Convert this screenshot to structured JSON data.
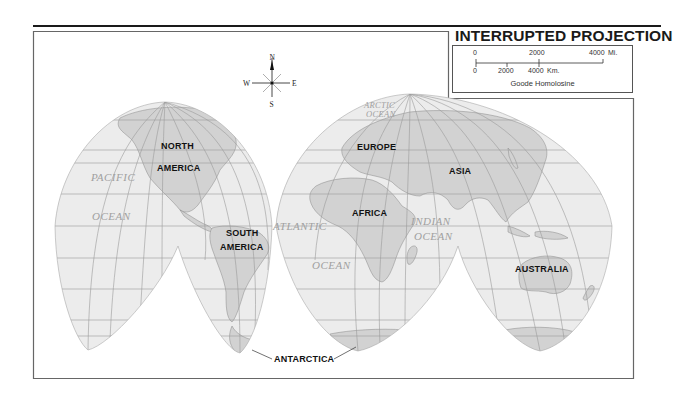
{
  "title": "INTERRUPTED PROJECTION",
  "scale": {
    "miles": {
      "ticks": [
        "0",
        "2000",
        "4000"
      ],
      "unit": "Mi."
    },
    "kilometers": {
      "ticks": [
        "0",
        "2000",
        "4000"
      ],
      "unit": "Km."
    },
    "caption": "Goode Homolosine"
  },
  "compass": {
    "north": "N",
    "south": "S",
    "east": "E",
    "west": "W"
  },
  "continents": {
    "north_america": [
      "NORTH",
      "AMERICA"
    ],
    "south_america": [
      "SOUTH",
      "AMERICA"
    ],
    "europe": "EUROPE",
    "asia": "ASIA",
    "africa": "AFRICA",
    "australia": "AUSTRALIA",
    "antarctica": "ANTARCTICA"
  },
  "oceans": {
    "pacific": [
      "PACIFIC",
      "OCEAN"
    ],
    "atlantic": [
      "ATLANTIC",
      "OCEAN"
    ],
    "indian": [
      "INDIAN",
      "OCEAN"
    ],
    "arctic": [
      "ARCTIC",
      "OCEAN"
    ]
  },
  "colors": {
    "ocean_fill": "#ececec",
    "land_fill": "#d2d2d2",
    "grid": "#9a9a9a",
    "frame": "#666666",
    "ink": "#111111",
    "ocean_label": "#a0a0a0"
  }
}
